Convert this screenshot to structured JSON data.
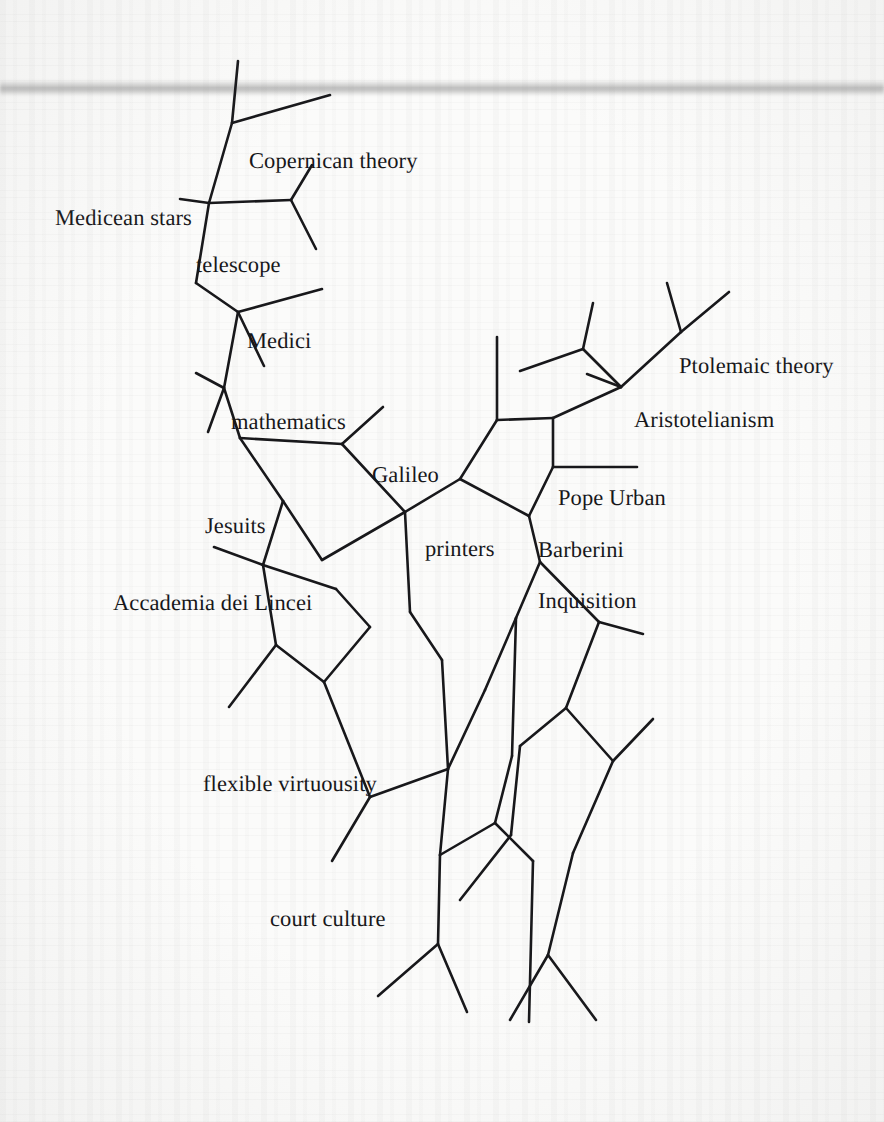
{
  "page": {
    "kind": "scanned-book-page",
    "background_color": "#fbfbfa",
    "ink_color": "#18181b",
    "width": 884,
    "height": 1122
  },
  "diagram": {
    "title": "",
    "type": "network-diagram",
    "stroke_color": "#18181b",
    "stroke_width": 2.6,
    "nodes": [
      {
        "id": "copernican-theory",
        "label": "Copernican theory",
        "x": 249,
        "y": 150
      },
      {
        "id": "medicean-stars",
        "label": "Medicean stars",
        "x": 55,
        "y": 207
      },
      {
        "id": "telescope",
        "label": "telescope",
        "x": 196,
        "y": 254
      },
      {
        "id": "medici",
        "label": "Medici",
        "x": 247,
        "y": 330
      },
      {
        "id": "mathematics",
        "label": "mathematics",
        "x": 231,
        "y": 411
      },
      {
        "id": "galileo",
        "label": "Galileo",
        "x": 372,
        "y": 464
      },
      {
        "id": "jesuits",
        "label": "Jesuits",
        "x": 205,
        "y": 515
      },
      {
        "id": "printers",
        "label": "printers",
        "x": 425,
        "y": 538
      },
      {
        "id": "accademia-dei-lincei",
        "label": "Accademia dei Lincei",
        "x": 113,
        "y": 592
      },
      {
        "id": "ptolemaic-theory",
        "label": "Ptolemaic theory",
        "x": 679,
        "y": 355
      },
      {
        "id": "aristotelianism",
        "label": "Aristotelianism",
        "x": 634,
        "y": 409
      },
      {
        "id": "pope-urban",
        "label": "Pope Urban",
        "x": 558,
        "y": 487
      },
      {
        "id": "barberini",
        "label": "Barberini",
        "x": 538,
        "y": 539
      },
      {
        "id": "inquisition",
        "label": "Inquisition",
        "x": 538,
        "y": 590
      },
      {
        "id": "flexible-virtuousity",
        "label": "flexible virtuousity",
        "x": 203,
        "y": 773
      },
      {
        "id": "court-culture",
        "label": "court culture",
        "x": 270,
        "y": 908
      }
    ],
    "edges": [
      {
        "id": "e01",
        "points": [
          [
            238,
            61
          ],
          [
            232,
            123
          ]
        ]
      },
      {
        "id": "e02",
        "points": [
          [
            232,
            123
          ],
          [
            330,
            95
          ]
        ]
      },
      {
        "id": "e03",
        "points": [
          [
            232,
            123
          ],
          [
            209,
            203
          ]
        ]
      },
      {
        "id": "e04",
        "points": [
          [
            209,
            203
          ],
          [
            180,
            199
          ]
        ]
      },
      {
        "id": "e05",
        "points": [
          [
            209,
            203
          ],
          [
            291,
            200
          ]
        ]
      },
      {
        "id": "e06",
        "points": [
          [
            291,
            200
          ],
          [
            312,
            165
          ]
        ]
      },
      {
        "id": "e07",
        "points": [
          [
            291,
            200
          ],
          [
            316,
            249
          ]
        ]
      },
      {
        "id": "e08",
        "points": [
          [
            209,
            203
          ],
          [
            196,
            283
          ]
        ]
      },
      {
        "id": "e09",
        "points": [
          [
            196,
            283
          ],
          [
            238,
            312
          ]
        ]
      },
      {
        "id": "e10",
        "points": [
          [
            238,
            312
          ],
          [
            322,
            289
          ]
        ]
      },
      {
        "id": "e11",
        "points": [
          [
            238,
            312
          ],
          [
            264,
            366
          ]
        ]
      },
      {
        "id": "e12",
        "points": [
          [
            238,
            312
          ],
          [
            224,
            388
          ]
        ]
      },
      {
        "id": "e13",
        "points": [
          [
            224,
            388
          ],
          [
            196,
            373
          ]
        ]
      },
      {
        "id": "e14",
        "points": [
          [
            224,
            388
          ],
          [
            240,
            438
          ]
        ]
      },
      {
        "id": "e15",
        "points": [
          [
            224,
            388
          ],
          [
            208,
            432
          ]
        ]
      },
      {
        "id": "e16",
        "points": [
          [
            240,
            438
          ],
          [
            342,
            444
          ]
        ]
      },
      {
        "id": "e17",
        "points": [
          [
            342,
            444
          ],
          [
            383,
            407
          ]
        ]
      },
      {
        "id": "e18",
        "points": [
          [
            342,
            444
          ],
          [
            405,
            512
          ]
        ]
      },
      {
        "id": "e19",
        "points": [
          [
            240,
            438
          ],
          [
            283,
            501
          ]
        ]
      },
      {
        "id": "e20",
        "points": [
          [
            283,
            501
          ],
          [
            322,
            560
          ]
        ]
      },
      {
        "id": "e21",
        "points": [
          [
            322,
            560
          ],
          [
            405,
            512
          ]
        ]
      },
      {
        "id": "e22",
        "points": [
          [
            283,
            501
          ],
          [
            263,
            565
          ]
        ]
      },
      {
        "id": "e23",
        "points": [
          [
            263,
            565
          ],
          [
            214,
            547
          ]
        ]
      },
      {
        "id": "e24",
        "points": [
          [
            263,
            565
          ],
          [
            276,
            645
          ]
        ]
      },
      {
        "id": "e25",
        "points": [
          [
            263,
            565
          ],
          [
            336,
            589
          ]
        ]
      },
      {
        "id": "e26",
        "points": [
          [
            336,
            589
          ],
          [
            370,
            627
          ]
        ]
      },
      {
        "id": "e27",
        "points": [
          [
            370,
            627
          ],
          [
            324,
            682
          ]
        ]
      },
      {
        "id": "e28",
        "points": [
          [
            324,
            682
          ],
          [
            276,
            645
          ]
        ]
      },
      {
        "id": "e29",
        "points": [
          [
            276,
            645
          ],
          [
            229,
            707
          ]
        ]
      },
      {
        "id": "e30",
        "points": [
          [
            405,
            512
          ],
          [
            410,
            612
          ]
        ]
      },
      {
        "id": "e31",
        "points": [
          [
            410,
            612
          ],
          [
            442,
            660
          ]
        ]
      },
      {
        "id": "e32",
        "points": [
          [
            442,
            660
          ],
          [
            448,
            769
          ]
        ]
      },
      {
        "id": "e33",
        "points": [
          [
            405,
            512
          ],
          [
            460,
            479
          ]
        ]
      },
      {
        "id": "e34",
        "points": [
          [
            460,
            479
          ],
          [
            497,
            420
          ]
        ]
      },
      {
        "id": "e35",
        "points": [
          [
            497,
            420
          ],
          [
            497,
            337
          ]
        ]
      },
      {
        "id": "e36",
        "points": [
          [
            497,
            420
          ],
          [
            553,
            418
          ]
        ]
      },
      {
        "id": "e37",
        "points": [
          [
            553,
            418
          ],
          [
            553,
            467
          ]
        ]
      },
      {
        "id": "e38",
        "points": [
          [
            553,
            418
          ],
          [
            621,
            387
          ]
        ]
      },
      {
        "id": "e39",
        "points": [
          [
            621,
            387
          ],
          [
            587,
            374
          ]
        ]
      },
      {
        "id": "e40",
        "points": [
          [
            621,
            387
          ],
          [
            583,
            349
          ]
        ]
      },
      {
        "id": "e41",
        "points": [
          [
            583,
            349
          ],
          [
            520,
            371
          ]
        ]
      },
      {
        "id": "e42",
        "points": [
          [
            583,
            349
          ],
          [
            593,
            303
          ]
        ]
      },
      {
        "id": "e43",
        "points": [
          [
            621,
            387
          ],
          [
            681,
            332
          ]
        ]
      },
      {
        "id": "e44",
        "points": [
          [
            681,
            332
          ],
          [
            667,
            283
          ]
        ]
      },
      {
        "id": "e45",
        "points": [
          [
            681,
            332
          ],
          [
            729,
            292
          ]
        ]
      },
      {
        "id": "e46",
        "points": [
          [
            553,
            467
          ],
          [
            529,
            516
          ]
        ]
      },
      {
        "id": "e47",
        "points": [
          [
            460,
            479
          ],
          [
            529,
            516
          ]
        ]
      },
      {
        "id": "e48",
        "points": [
          [
            553,
            467
          ],
          [
            637,
            467
          ]
        ]
      },
      {
        "id": "e49",
        "points": [
          [
            529,
            516
          ],
          [
            540,
            562
          ]
        ]
      },
      {
        "id": "e50",
        "points": [
          [
            540,
            562
          ],
          [
            599,
            622
          ]
        ]
      },
      {
        "id": "e51",
        "points": [
          [
            599,
            622
          ],
          [
            643,
            634
          ]
        ]
      },
      {
        "id": "e52",
        "points": [
          [
            599,
            622
          ],
          [
            566,
            708
          ]
        ]
      },
      {
        "id": "e53",
        "points": [
          [
            566,
            708
          ],
          [
            520,
            746
          ]
        ]
      },
      {
        "id": "e54",
        "points": [
          [
            566,
            708
          ],
          [
            613,
            761
          ]
        ]
      },
      {
        "id": "e55",
        "points": [
          [
            613,
            761
          ],
          [
            653,
            719
          ]
        ]
      },
      {
        "id": "e56",
        "points": [
          [
            613,
            761
          ],
          [
            573,
            853
          ]
        ]
      },
      {
        "id": "e57",
        "points": [
          [
            540,
            562
          ],
          [
            516,
            618
          ]
        ]
      },
      {
        "id": "e58",
        "points": [
          [
            516,
            618
          ],
          [
            512,
            756
          ]
        ]
      },
      {
        "id": "e59",
        "points": [
          [
            512,
            756
          ],
          [
            495,
            823
          ]
        ]
      },
      {
        "id": "e60",
        "points": [
          [
            495,
            823
          ],
          [
            533,
            861
          ]
        ]
      },
      {
        "id": "e61",
        "points": [
          [
            495,
            823
          ],
          [
            440,
            855
          ]
        ]
      },
      {
        "id": "e62",
        "points": [
          [
            440,
            855
          ],
          [
            448,
            769
          ]
        ]
      },
      {
        "id": "e63",
        "points": [
          [
            448,
            769
          ],
          [
            370,
            797
          ]
        ]
      },
      {
        "id": "e64",
        "points": [
          [
            370,
            797
          ],
          [
            324,
            682
          ]
        ]
      },
      {
        "id": "e65",
        "points": [
          [
            370,
            797
          ],
          [
            332,
            861
          ]
        ]
      },
      {
        "id": "e66",
        "points": [
          [
            440,
            855
          ],
          [
            438,
            944
          ]
        ]
      },
      {
        "id": "e67",
        "points": [
          [
            438,
            944
          ],
          [
            378,
            996
          ]
        ]
      },
      {
        "id": "e68",
        "points": [
          [
            438,
            944
          ],
          [
            467,
            1012
          ]
        ]
      },
      {
        "id": "e69",
        "points": [
          [
            533,
            861
          ],
          [
            529,
            1022
          ]
        ]
      },
      {
        "id": "e70",
        "points": [
          [
            573,
            853
          ],
          [
            548,
            955
          ]
        ]
      },
      {
        "id": "e71",
        "points": [
          [
            548,
            955
          ],
          [
            510,
            1020
          ]
        ]
      },
      {
        "id": "e72",
        "points": [
          [
            548,
            955
          ],
          [
            596,
            1020
          ]
        ]
      },
      {
        "id": "e73",
        "points": [
          [
            520,
            746
          ],
          [
            511,
            835
          ]
        ]
      },
      {
        "id": "e74",
        "points": [
          [
            511,
            835
          ],
          [
            460,
            900
          ]
        ]
      },
      {
        "id": "e75",
        "points": [
          [
            516,
            618
          ],
          [
            485,
            690
          ]
        ]
      },
      {
        "id": "e76",
        "points": [
          [
            485,
            690
          ],
          [
            448,
            769
          ]
        ]
      }
    ]
  }
}
